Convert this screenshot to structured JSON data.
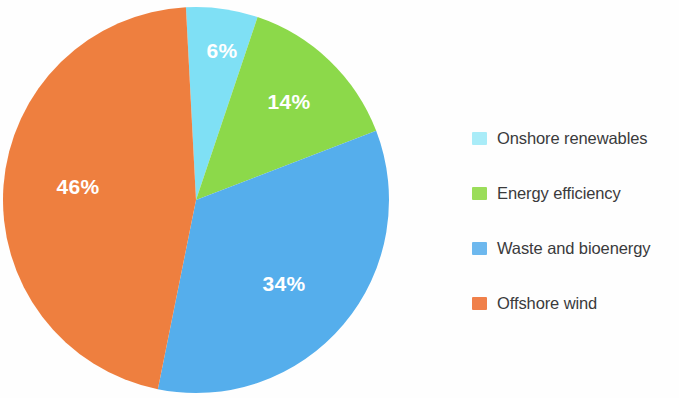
{
  "chart_data": {
    "type": "pie",
    "title": "",
    "categories": [
      "Onshore renewables",
      "Energy efficiency",
      "Waste and bioenergy",
      "Offshore wind"
    ],
    "values": [
      6,
      14,
      34,
      46
    ],
    "value_labels": [
      "6%",
      "14%",
      "34%",
      "46%"
    ],
    "colors": [
      "#7FE0F5",
      "#8CD94A",
      "#55AEEC",
      "#EE7F3F"
    ],
    "legend_swatch_colors": [
      "#A9ECF8",
      "#9BDD5A",
      "#6DB8EE",
      "#F0804A"
    ],
    "unit": "%",
    "total": 100,
    "start_angle_deg": -3,
    "direction": "clockwise",
    "legend_position": "right",
    "label_color": "#ffffff",
    "background": "#fefefe"
  },
  "chart": {
    "slices": [
      {
        "id": "onshore-renewables",
        "label": "6%",
        "value": 6,
        "color": "#7FE0F5",
        "label_x": 222,
        "label_y": 52
      },
      {
        "id": "energy-efficiency",
        "label": "14%",
        "value": 14,
        "color": "#8CD94A",
        "label_x": 289,
        "label_y": 103
      },
      {
        "id": "waste-and-bioenergy",
        "label": "34%",
        "value": 34,
        "color": "#55AEEC",
        "label_x": 284,
        "label_y": 285
      },
      {
        "id": "offshore-wind",
        "label": "46%",
        "value": 46,
        "color": "#EE7F3F",
        "label_x": 78,
        "label_y": 188
      }
    ]
  },
  "legend": {
    "items": [
      {
        "label": "Onshore renewables",
        "color": "#A9ECF8"
      },
      {
        "label": "Energy efficiency",
        "color": "#9BDD5A"
      },
      {
        "label": "Waste and bioenergy",
        "color": "#6DB8EE"
      },
      {
        "label": "Offshore wind",
        "color": "#F0804A"
      }
    ]
  }
}
